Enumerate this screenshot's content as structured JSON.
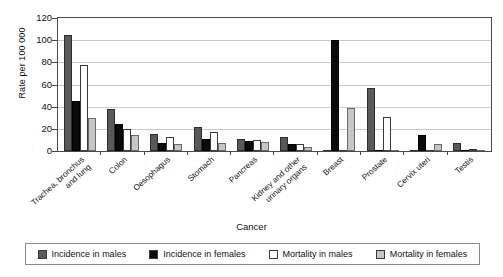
{
  "chart_data": {
    "type": "bar",
    "title": "",
    "xlabel": "Cancer",
    "ylabel": "Rate per 100 000",
    "ylim": [
      0,
      120
    ],
    "yticks": [
      0,
      20,
      40,
      60,
      80,
      100,
      120
    ],
    "grid": true,
    "legend_position": "bottom",
    "categories": [
      "Trachea, bronchus and lung",
      "Colon",
      "Oesophagus",
      "Stomach",
      "Pancreas",
      "Kidney and other urinary organs",
      "Breast",
      "Prostate",
      "Cervix uteri",
      "Testis"
    ],
    "series": [
      {
        "name": "Incidence in males",
        "color": "#595959",
        "values": [
          105,
          38,
          15,
          21.5,
          10.5,
          13,
          0,
          57,
          0,
          7
        ]
      },
      {
        "name": "Incidence in females",
        "color": "#0b0b0b",
        "values": [
          45,
          24,
          7,
          11,
          9,
          6,
          100,
          0,
          14,
          0
        ]
      },
      {
        "name": "Mortality in males",
        "color": "#ffffff",
        "values": [
          78,
          20,
          13,
          17,
          10,
          6,
          0,
          31,
          0,
          0.5
        ]
      },
      {
        "name": "Mortality in females",
        "color": "#c6c6c6",
        "values": [
          30,
          14.5,
          6,
          7.5,
          8,
          3.5,
          39,
          0,
          6,
          0
        ]
      }
    ]
  },
  "legend": {
    "items": [
      {
        "label": "Incidence in males"
      },
      {
        "label": "Incidence in females"
      },
      {
        "label": "Mortality in males"
      },
      {
        "label": "Mortality in females"
      }
    ]
  }
}
